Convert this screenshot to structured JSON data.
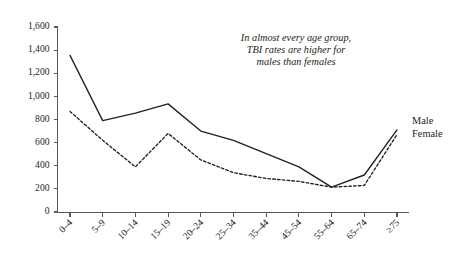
{
  "chart_data": {
    "type": "line",
    "title": "",
    "subtitle": "",
    "xlabel": "",
    "ylabel": "",
    "categories": [
      "0–4",
      "5–9",
      "10–14",
      "15–19",
      "20–24",
      "25–34",
      "35–44",
      "45–54",
      "55–64",
      "65–74",
      "≥75"
    ],
    "series": [
      {
        "name": "Male",
        "style": "solid",
        "values": [
          1355,
          790,
          855,
          935,
          700,
          620,
          505,
          390,
          215,
          320,
          710
        ]
      },
      {
        "name": "Female",
        "style": "dashed",
        "values": [
          870,
          620,
          390,
          680,
          450,
          340,
          290,
          265,
          215,
          230,
          670
        ]
      }
    ],
    "ylim": [
      0,
      1600
    ],
    "yticks": [
      0,
      200,
      400,
      600,
      800,
      1000,
      1200,
      1400,
      1600
    ],
    "ytick_labels": [
      "0",
      "200",
      "400",
      "600",
      "800",
      "1,000",
      "1,200",
      "1,400",
      "1,600"
    ],
    "grid": false,
    "legend_position": "right-inline",
    "annotations": [
      "In almost every age group,",
      "TBI rates are higher for",
      "males than females"
    ]
  },
  "legend": {
    "male_label": "Male",
    "female_label": "Female"
  },
  "colors": {
    "line": "#231f20",
    "axis": "#58595b",
    "background": "#ffffff"
  }
}
